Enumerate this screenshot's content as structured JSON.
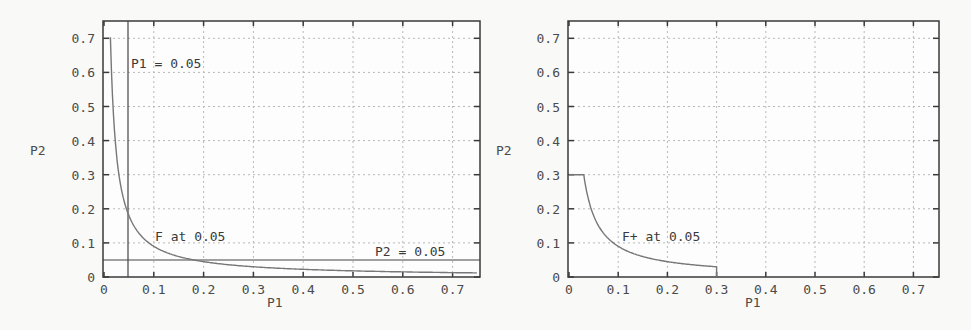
{
  "chart_data": [
    {
      "type": "line",
      "title": "",
      "xlabel": "P1",
      "ylabel": "P2",
      "xlim": [
        0,
        0.75
      ],
      "ylim": [
        0,
        0.75
      ],
      "grid": true,
      "xticks": [
        "0",
        "0.1",
        "0.2",
        "0.3",
        "0.4",
        "0.5",
        "0.6",
        "0.7"
      ],
      "yticks": [
        "0",
        "0.1",
        "0.2",
        "0.3",
        "0.4",
        "0.5",
        "0.6",
        "0.7"
      ],
      "series": [
        {
          "name": "F at 0.05",
          "x": [
            0.013,
            0.02,
            0.03,
            0.05,
            0.075,
            0.1,
            0.15,
            0.2,
            0.3,
            0.4,
            0.5,
            0.6,
            0.75
          ],
          "y": [
            0.7,
            0.45,
            0.3,
            0.18,
            0.12,
            0.09,
            0.06,
            0.045,
            0.03,
            0.0225,
            0.018,
            0.015,
            0.012
          ]
        }
      ],
      "reference_lines": [
        {
          "orientation": "vertical",
          "value": 0.05,
          "label": "P1 = 0.05"
        },
        {
          "orientation": "horizontal",
          "value": 0.05,
          "label": "P2 = 0.05"
        }
      ],
      "annotations": [
        {
          "text": "P1 = 0.05",
          "x": 0.055,
          "y": 0.6
        },
        {
          "text": "F at 0.05",
          "x": 0.1,
          "y": 0.1
        },
        {
          "text": "P2 = 0.05",
          "x": 0.55,
          "y": 0.06
        }
      ]
    },
    {
      "type": "line",
      "title": "",
      "xlabel": "P1",
      "ylabel": "P2",
      "xlim": [
        0,
        0.75
      ],
      "ylim": [
        0,
        0.75
      ],
      "grid": true,
      "xticks": [
        "0",
        "0.1",
        "0.2",
        "0.3",
        "0.4",
        "0.5",
        "0.6",
        "0.7"
      ],
      "yticks": [
        "0",
        "0.1",
        "0.2",
        "0.3",
        "0.4",
        "0.5",
        "0.6",
        "0.7"
      ],
      "series": [
        {
          "name": "F+ at 0.05",
          "x": [
            0,
            0.03,
            0.04,
            0.05,
            0.075,
            0.1,
            0.15,
            0.2,
            0.25,
            0.3,
            0.3
          ],
          "y": [
            0.3,
            0.3,
            0.225,
            0.18,
            0.12,
            0.09,
            0.06,
            0.045,
            0.036,
            0.03,
            0
          ]
        }
      ],
      "annotations": [
        {
          "text": "F+ at 0.05",
          "x": 0.1,
          "y": 0.1
        }
      ]
    }
  ],
  "charts": [
    {
      "xlabel": "P1",
      "ylabel": "P2",
      "xticks": [
        "0",
        "0.1",
        "0.2",
        "0.3",
        "0.4",
        "0.5",
        "0.6",
        "0.7"
      ],
      "yticks": [
        "0",
        "0.1",
        "0.2",
        "0.3",
        "0.4",
        "0.5",
        "0.6",
        "0.7"
      ],
      "annotations": [
        "P1 = 0.05",
        "F at 0.05",
        "P2 = 0.05"
      ]
    },
    {
      "xlabel": "P1",
      "ylabel": "P2",
      "xticks": [
        "0",
        "0.1",
        "0.2",
        "0.3",
        "0.4",
        "0.5",
        "0.6",
        "0.7"
      ],
      "yticks": [
        "0",
        "0.1",
        "0.2",
        "0.3",
        "0.4",
        "0.5",
        "0.6",
        "0.7"
      ],
      "annotations": [
        "F+ at 0.05"
      ]
    }
  ]
}
